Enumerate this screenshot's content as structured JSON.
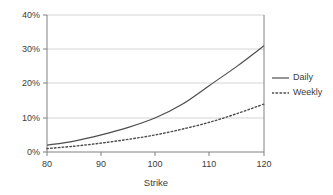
{
  "chart_data": {
    "type": "line",
    "title": "",
    "xlabel": "Strike",
    "ylabel": "",
    "xlim": [
      80,
      120
    ],
    "ylim": [
      0,
      40
    ],
    "grid": "horizontal",
    "legend_position": "right",
    "x_tick_labels": [
      "80",
      "90",
      "100",
      "110",
      "120"
    ],
    "y_tick_labels": [
      "0%",
      "10%",
      "20%",
      "30%",
      "40%"
    ],
    "x": [
      80,
      85,
      90,
      95,
      100,
      105,
      110,
      115,
      120
    ],
    "series": [
      {
        "name": "Daily",
        "style": "solid",
        "color": "#4d4d4d",
        "values": [
          2.0,
          3.2,
          5.0,
          7.2,
          10.0,
          14.0,
          19.5,
          25.0,
          31.0
        ]
      },
      {
        "name": "Weekly",
        "style": "dotted",
        "color": "#4d4d4d",
        "values": [
          1.0,
          1.7,
          2.6,
          3.7,
          5.0,
          6.7,
          8.7,
          11.2,
          14.0
        ]
      }
    ]
  },
  "axes": {
    "frame_color": "#808080",
    "gridline_color": "#d4d4d4",
    "x_ticks": [
      {
        "label": "80",
        "value": 80
      },
      {
        "label": "90",
        "value": 90
      },
      {
        "label": "100",
        "value": 100
      },
      {
        "label": "110",
        "value": 110
      },
      {
        "label": "120",
        "value": 120
      }
    ],
    "y_ticks": [
      {
        "label": "40%",
        "value": 40
      },
      {
        "label": "30%",
        "value": 30
      },
      {
        "label": "20%",
        "value": 20
      },
      {
        "label": "10%",
        "value": 10
      },
      {
        "label": "0%",
        "value": 0
      }
    ],
    "x_axis_title": "Strike"
  },
  "legend": {
    "entries": [
      {
        "label": "Daily",
        "style": "solid"
      },
      {
        "label": "Weekly",
        "style": "dotted"
      }
    ]
  }
}
